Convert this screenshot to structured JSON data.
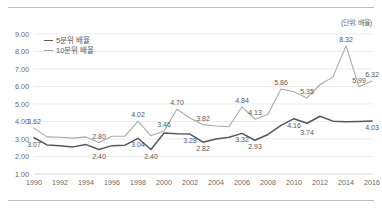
{
  "unit_note": "(단위: 배율)",
  "legend": {
    "position": "top-left-inside",
    "items": [
      {
        "label": "5분위 배율",
        "color": "#56575a"
      },
      {
        "label": "10분위 배율",
        "color": "#a7a9ac"
      }
    ]
  },
  "chart_data": {
    "type": "line",
    "title": "",
    "subtitle": "",
    "xlabel": "",
    "ylabel": "",
    "unit": "(단위: 배율)",
    "grid": true,
    "legend_position": "top-left-inside",
    "ylim": [
      1.0,
      9.0
    ],
    "ytick_labels": [
      "1.00",
      "2.00",
      "3.00",
      "4.00",
      "5.00",
      "6.00",
      "7.00",
      "8.00",
      "9.00"
    ],
    "ytick_values": [
      1.0,
      2.0,
      3.0,
      4.0,
      5.0,
      6.0,
      7.0,
      8.0,
      9.0
    ],
    "x": [
      1990,
      1991,
      1992,
      1993,
      1994,
      1995,
      1996,
      1997,
      1998,
      1999,
      2000,
      2001,
      2002,
      2003,
      2004,
      2005,
      2006,
      2007,
      2008,
      2009,
      2010,
      2011,
      2012,
      2013,
      2014,
      2015,
      2016
    ],
    "xtick_labels": [
      "1990",
      "1992",
      "1994",
      "1996",
      "1998",
      "2000",
      "2002",
      "2004",
      "2006",
      "2008",
      "2010",
      "2012",
      "2014",
      "2016"
    ],
    "xtick_values": [
      1990,
      1992,
      1994,
      1996,
      1998,
      2000,
      2002,
      2004,
      2006,
      2008,
      2010,
      2012,
      2014,
      2016
    ],
    "series": [
      {
        "name": "5분위 배율",
        "color": "#56575a",
        "values": [
          3.07,
          2.66,
          2.62,
          2.55,
          2.68,
          2.4,
          2.62,
          2.65,
          3.04,
          2.4,
          3.34,
          3.3,
          3.28,
          2.82,
          3.0,
          3.1,
          3.32,
          2.93,
          3.26,
          3.78,
          4.16,
          3.9,
          4.3,
          4.02,
          3.98,
          4.0,
          4.03
        ],
        "labels": [
          {
            "x": 1990,
            "value": 3.07,
            "text": "3.07"
          },
          {
            "x": 1995,
            "value": 2.4,
            "text": "2.40"
          },
          {
            "x": 1998,
            "value": 3.04,
            "text": "3.04"
          },
          {
            "x": 1999,
            "value": 2.4,
            "text": "2.40"
          },
          {
            "x": 2002,
            "value": 3.28,
            "text": "3.28"
          },
          {
            "x": 2003,
            "value": 2.82,
            "text": "2.82"
          },
          {
            "x": 2006,
            "value": 3.32,
            "text": "3.32"
          },
          {
            "x": 2007,
            "value": 2.93,
            "text": "2.93"
          },
          {
            "x": 2010,
            "value": 4.16,
            "text": "4.16"
          },
          {
            "x": 2011,
            "value": 3.74,
            "text": "3.74"
          },
          {
            "x": 2016,
            "value": 4.03,
            "text": "4.03"
          }
        ]
      },
      {
        "name": "10분위 배율",
        "color": "#a7a9ac",
        "values": [
          3.62,
          3.12,
          3.1,
          3.05,
          3.12,
          2.8,
          3.16,
          3.16,
          4.02,
          3.18,
          3.46,
          4.7,
          4.2,
          3.82,
          3.74,
          3.7,
          4.84,
          4.13,
          4.42,
          5.86,
          5.7,
          5.35,
          6.1,
          6.55,
          8.32,
          5.99,
          6.32
        ],
        "labels": [
          {
            "x": 1990,
            "value": 3.62,
            "text": "3.62"
          },
          {
            "x": 1995,
            "value": 2.8,
            "text": "2.80"
          },
          {
            "x": 1998,
            "value": 4.02,
            "text": "4.02"
          },
          {
            "x": 2000,
            "value": 3.46,
            "text": "3.46"
          },
          {
            "x": 2001,
            "value": 4.7,
            "text": "4.70"
          },
          {
            "x": 2003,
            "value": 3.82,
            "text": "3.82"
          },
          {
            "x": 2006,
            "value": 4.84,
            "text": "4.84"
          },
          {
            "x": 2007,
            "value": 4.13,
            "text": "4.13"
          },
          {
            "x": 2009,
            "value": 5.86,
            "text": "5.86"
          },
          {
            "x": 2011,
            "value": 5.35,
            "text": "5.35"
          },
          {
            "x": 2014,
            "value": 8.32,
            "text": "8.32"
          },
          {
            "x": 2015,
            "value": 5.99,
            "text": "5.99"
          },
          {
            "x": 2016,
            "value": 6.32,
            "text": "6.32"
          }
        ]
      }
    ]
  },
  "colors": {
    "series_primary": "#56575a",
    "series_secondary": "#a7a9ac",
    "gridline": "#e3e4e6",
    "axis": "#c8c9cb",
    "rule": "#b9bbbd",
    "text": "#58595b"
  }
}
